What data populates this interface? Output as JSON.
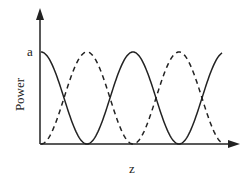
{
  "chart_data": {
    "type": "line",
    "title": "",
    "xlabel": "z",
    "ylabel": "Power",
    "y_tick_labels": [
      "a"
    ],
    "ylim": [
      0,
      "a"
    ],
    "grid": false,
    "legend": null,
    "x": [
      0,
      0.5,
      1,
      1.5,
      2,
      2.5,
      3,
      3.5,
      4
    ],
    "series": [
      {
        "name": "solid",
        "style": "solid",
        "values": [
          "a",
          "a/2",
          0,
          "a/2",
          "a",
          "a/2",
          0,
          "a/2",
          "a"
        ],
        "description": "a*cos^2(pi z / 2)"
      },
      {
        "name": "dashed",
        "style": "dashed",
        "values": [
          0,
          "a/2",
          "a",
          "a/2",
          0,
          "a/2",
          "a",
          "a/2",
          0
        ],
        "description": "a*sin^2(pi z / 2)"
      }
    ]
  },
  "labels": {
    "y_tick": "a",
    "ylabel": "Power",
    "xlabel": "z"
  }
}
